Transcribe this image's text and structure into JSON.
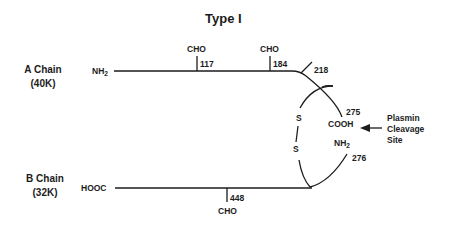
{
  "title": "Type I",
  "chains": {
    "a": {
      "name": "A Chain",
      "mass": "(40K)",
      "terminus": "NH",
      "terminus_sub": "2"
    },
    "b": {
      "name": "B Chain",
      "mass": "(32K)",
      "terminus": "HOOC"
    }
  },
  "glycosylation": [
    {
      "label": "CHO",
      "residue": "117",
      "chain": "A"
    },
    {
      "label": "CHO",
      "residue": "184",
      "chain": "A"
    },
    {
      "label": "CHO",
      "residue": "448",
      "chain": "B"
    }
  ],
  "sites": {
    "residue_218": "218",
    "residue_275": "275",
    "cooh": "COOH",
    "nh": "NH",
    "nh_sub": "2",
    "residue_276": "276",
    "disulfide_top": "S",
    "disulfide_bottom": "S"
  },
  "annotation": {
    "line1": "Plasmin",
    "line2": "Cleavage",
    "line3": "Site"
  },
  "colors": {
    "ink": "#1c1c1c",
    "background": "#ffffff"
  }
}
